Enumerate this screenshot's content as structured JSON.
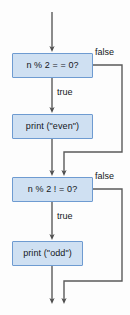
{
  "diagram": {
    "colors": {
      "node_fill": "#cfe0f2",
      "node_border": "#6e9bd1",
      "connector": "#5a5a5a",
      "text": "#14161a",
      "background": "#fdfdfd"
    },
    "nodes": [
      {
        "id": "decision-even",
        "kind": "decision",
        "label": "n % 2 = = 0?",
        "x": 12,
        "y": 53,
        "width": 81,
        "height": 25
      },
      {
        "id": "print-even",
        "kind": "process",
        "label": "print (\"even\")",
        "x": 12,
        "y": 114,
        "width": 81,
        "height": 25
      },
      {
        "id": "decision-odd",
        "kind": "decision",
        "label": "n % 2 ! = 0?",
        "x": 12,
        "y": 177,
        "width": 81,
        "height": 25
      },
      {
        "id": "print-odd",
        "kind": "process",
        "label": "print (\"odd\")",
        "x": 12,
        "y": 241,
        "width": 71,
        "height": 25
      }
    ],
    "edge_labels": [
      {
        "id": "false-even",
        "text": "false",
        "x": 95,
        "y": 48
      },
      {
        "id": "true-even",
        "text": "true",
        "x": 57,
        "y": 88
      },
      {
        "id": "false-odd",
        "text": "false",
        "x": 95,
        "y": 172
      },
      {
        "id": "true-odd",
        "text": "true",
        "x": 57,
        "y": 212
      }
    ],
    "connectors": [
      {
        "id": "entry-to-decision-even",
        "path": "M52,12 L52,49"
      },
      {
        "id": "decision-even-true-to-print",
        "path": "M52,78 L52,110"
      },
      {
        "id": "print-even-to-decision-odd",
        "path": "M52,139 L52,173"
      },
      {
        "id": "decision-even-false-bypass",
        "path": "M93,65 L122,65 L122,152 L64,152 L64,173"
      },
      {
        "id": "decision-odd-true-to-print",
        "path": "M52,202 L52,237"
      },
      {
        "id": "print-odd-to-exit",
        "path": "M52,266 L52,301"
      },
      {
        "id": "decision-odd-false-bypass",
        "path": "M93,189 L122,189 L122,281 L64,281 L64,301"
      }
    ]
  }
}
